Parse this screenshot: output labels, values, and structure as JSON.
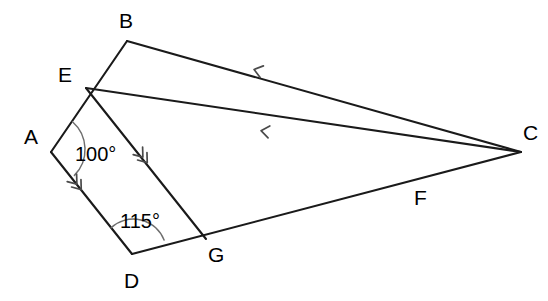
{
  "figure": {
    "background_color": "#ffffff",
    "line_color": "#1a1a1a",
    "arc_color": "#6e6e6e",
    "tick_color": "#4a4a4a",
    "label_color": "#000000",
    "width": 548,
    "height": 301
  },
  "vertices": [
    {
      "name": "A",
      "label": "A",
      "x": 51,
      "y": 152,
      "label_x": 24,
      "label_y": 144
    },
    {
      "name": "B",
      "label": "B",
      "x": 127,
      "y": 41,
      "label_x": 119,
      "label_y": 28
    },
    {
      "name": "C",
      "label": "C",
      "x": 521,
      "y": 152,
      "label_x": 523,
      "label_y": 140
    },
    {
      "name": "D",
      "label": "D",
      "x": 132,
      "y": 254,
      "label_x": 124,
      "label_y": 288
    },
    {
      "name": "E",
      "label": "E",
      "x": 86,
      "y": 88,
      "label_x": 58,
      "label_y": 82
    },
    {
      "name": "F",
      "label": "F",
      "x": 408,
      "y": 182,
      "label_x": 414,
      "label_y": 205
    },
    {
      "name": "G",
      "label": "G",
      "x": 206,
      "y": 239,
      "label_x": 208,
      "label_y": 262
    }
  ],
  "segments": [
    {
      "name": "AB",
      "from": "A",
      "to": "B",
      "note": "left upper side through E"
    },
    {
      "name": "BC",
      "from": "B",
      "to": "C",
      "note": "top long side, single arrow"
    },
    {
      "name": "EC",
      "from": "E",
      "to": "C",
      "note": "middle long side through F, single arrow"
    },
    {
      "name": "AD",
      "from": "A",
      "to": "D",
      "note": "lower left side, double arrow"
    },
    {
      "name": "EG",
      "from": "E",
      "to": "G",
      "note": "inner transversal, double arrow"
    },
    {
      "name": "DC",
      "from": "D",
      "to": "C",
      "note": "bottom long side through G and F"
    }
  ],
  "angles": [
    {
      "name": "angle-at-A",
      "vertex": "A",
      "label": "100°",
      "value": 100,
      "unit": "degrees",
      "label_x": 75,
      "label_y": 161,
      "arcs": 1
    },
    {
      "name": "angle-at-D",
      "vertex": "D",
      "label": "115°",
      "value": 115,
      "unit": "degrees",
      "label_x": 120,
      "label_y": 228,
      "arcs": 1
    }
  ],
  "arrow_marks": [
    {
      "name": "arrow-on-BC",
      "segment": "BC",
      "count": 1,
      "x": 256,
      "y": 70,
      "direction": "toward-B"
    },
    {
      "name": "arrow-on-EC",
      "segment": "EC",
      "count": 1,
      "x": 263,
      "y": 131,
      "direction": "toward-E"
    },
    {
      "name": "arrow-on-AD",
      "segment": "AD",
      "count": 2,
      "x": 80,
      "y": 188,
      "direction": "toward-A"
    },
    {
      "name": "arrow-on-EG",
      "segment": "EG",
      "count": 2,
      "x": 146,
      "y": 161,
      "direction": "toward-E"
    }
  ]
}
